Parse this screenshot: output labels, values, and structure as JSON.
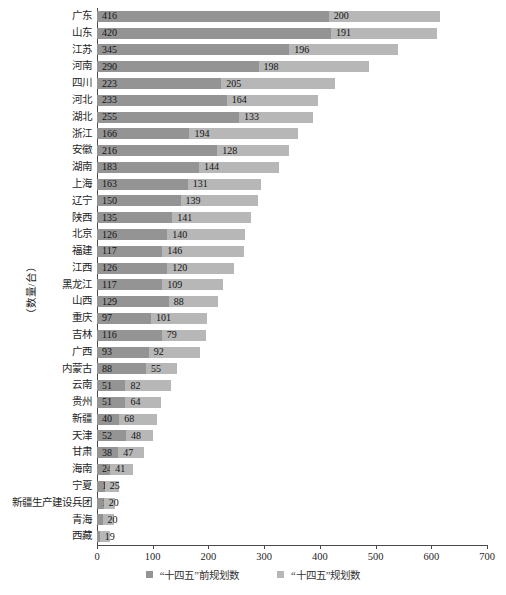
{
  "chart_data": {
    "type": "bar",
    "orientation": "horizontal",
    "stacked": true,
    "title": "",
    "ylabel": "（数量/台）",
    "xlabel": "",
    "xlim": [
      0,
      700
    ],
    "xticks": [
      0,
      100,
      200,
      300,
      400,
      500,
      600,
      700
    ],
    "grid": false,
    "legend_position": "bottom",
    "value_labels": "inside-start",
    "categories": [
      "广东",
      "山东",
      "江苏",
      "河南",
      "四川",
      "河北",
      "湖北",
      "浙江",
      "安徽",
      "湖南",
      "上海",
      "辽宁",
      "陕西",
      "北京",
      "福建",
      "江西",
      "黑龙江",
      "山西",
      "重庆",
      "吉林",
      "广西",
      "内蒙古",
      "云南",
      "贵州",
      "新疆",
      "天津",
      "甘肃",
      "海南",
      "宁夏",
      "新疆生产建设兵团",
      "青海",
      "西藏"
    ],
    "series": [
      {
        "name": "“十四五”前规划数",
        "color": "#949494",
        "values": [
          416,
          420,
          345,
          290,
          223,
          233,
          255,
          166,
          216,
          183,
          163,
          150,
          135,
          126,
          117,
          126,
          117,
          129,
          97,
          116,
          93,
          88,
          51,
          51,
          40,
          52,
          38,
          24,
          14,
          12,
          10,
          5
        ]
      },
      {
        "name": "“十四五”规划数",
        "color": "#b7b7b7",
        "values": [
          200,
          191,
          196,
          198,
          205,
          164,
          133,
          194,
          128,
          144,
          131,
          139,
          141,
          140,
          146,
          120,
          109,
          88,
          101,
          79,
          92,
          55,
          82,
          64,
          68,
          48,
          47,
          41,
          25,
          20,
          20,
          19
        ]
      }
    ]
  },
  "axis": {
    "color": "#4a4a4a"
  }
}
